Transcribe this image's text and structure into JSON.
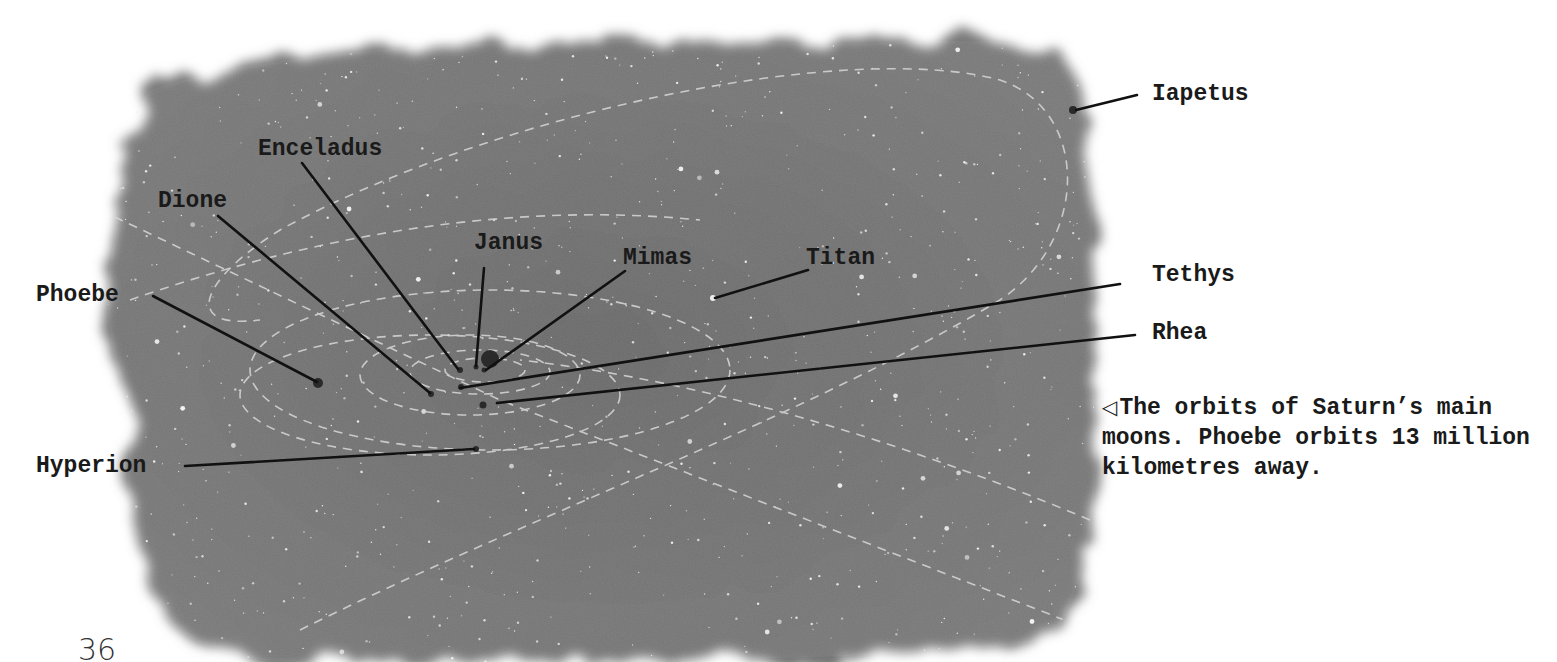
{
  "page": {
    "number": "36",
    "background": "#ffffff",
    "sky_color": "#6f6f6f"
  },
  "diagram": {
    "center_body": "Saturn",
    "labels": [
      {
        "id": "iapetus",
        "text": "Iapetus"
      },
      {
        "id": "enceladus",
        "text": "Enceladus"
      },
      {
        "id": "dione",
        "text": "Dione"
      },
      {
        "id": "janus",
        "text": "Janus"
      },
      {
        "id": "mimas",
        "text": "Mimas"
      },
      {
        "id": "titan",
        "text": "Titan"
      },
      {
        "id": "phoebe",
        "text": "Phoebe"
      },
      {
        "id": "tethys",
        "text": "Tethys"
      },
      {
        "id": "rhea",
        "text": "Rhea"
      },
      {
        "id": "hyperion",
        "text": "Hyperion"
      }
    ]
  },
  "caption": {
    "marker": "◁",
    "text": "The orbits of Saturn’s main moons. Phoebe orbits 13 million kilometres away."
  }
}
